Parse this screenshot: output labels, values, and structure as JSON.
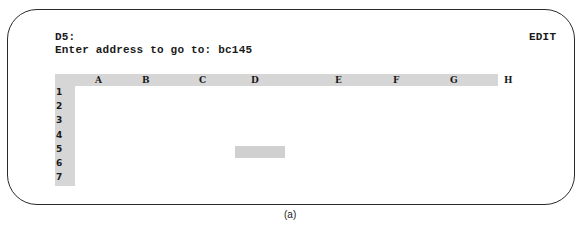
{
  "control_panel": {
    "cell_address": "D5:",
    "prompt": "Enter address to go to: bc145",
    "mode_indicator": "EDIT"
  },
  "worksheet": {
    "columns": [
      {
        "label": "A",
        "x": 75
      },
      {
        "label": "B",
        "x": 122
      },
      {
        "label": "C",
        "x": 179
      },
      {
        "label": "D",
        "x": 231
      },
      {
        "label": "E",
        "x": 315
      },
      {
        "label": "F",
        "x": 373
      },
      {
        "label": "G",
        "x": 430
      },
      {
        "label": "H",
        "x": 484
      }
    ],
    "rows": [
      "1",
      "2",
      "3",
      "4",
      "5",
      "6",
      "7"
    ],
    "highlighted_cell": "D5"
  },
  "caption": "(a)"
}
